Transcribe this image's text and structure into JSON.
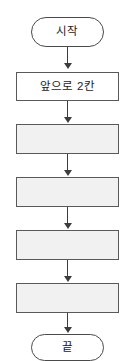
{
  "diagram": {
    "type": "flowchart",
    "title": "",
    "orientation": "vertical",
    "background_color": "#ffffff",
    "border_color": "#4a4a4a",
    "blank_fill_color": "#f1f1f1",
    "filled_fill_color": "#ffffff",
    "text_color": "#1c1c1c",
    "nodes": [
      {
        "id": "start",
        "shape": "terminator",
        "label": "시작",
        "filled": false
      },
      {
        "id": "step1",
        "shape": "process",
        "label": "앞으로 2칸",
        "filled": false
      },
      {
        "id": "step2",
        "shape": "process",
        "label": "",
        "filled": true
      },
      {
        "id": "step3",
        "shape": "process",
        "label": "",
        "filled": true
      },
      {
        "id": "step4",
        "shape": "process",
        "label": "",
        "filled": true
      },
      {
        "id": "step5",
        "shape": "process",
        "label": "",
        "filled": true
      },
      {
        "id": "end",
        "shape": "terminator",
        "label": "끝",
        "filled": false
      }
    ],
    "connectors": [
      {
        "from": "start",
        "to": "step1",
        "arrow": "down"
      },
      {
        "from": "step1",
        "to": "step2",
        "arrow": "down"
      },
      {
        "from": "step2",
        "to": "step3",
        "arrow": "down"
      },
      {
        "from": "step3",
        "to": "step4",
        "arrow": "down"
      },
      {
        "from": "step4",
        "to": "step5",
        "arrow": "down"
      },
      {
        "from": "step5",
        "to": "end",
        "arrow": "down"
      }
    ]
  }
}
